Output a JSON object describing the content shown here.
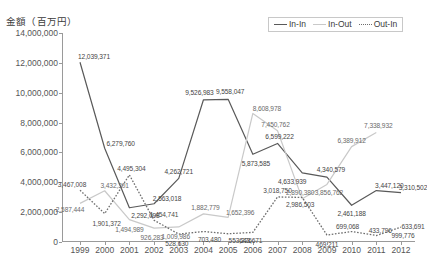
{
  "chart": {
    "axis": {
      "y_axis_title": "金額（百万円）",
      "y_ticks": [
        "14,000,000",
        "12,000,000",
        "10,000,000",
        "8,000,000",
        "6,000,000",
        "4,000,000",
        "2,000,000",
        "0"
      ]
    },
    "legend": {
      "items": [
        {
          "label": "In-In",
          "style": "solid",
          "color": "#595959"
        },
        {
          "label": "In-Out",
          "style": "solid",
          "color": "#c9c9c9"
        },
        {
          "label": "Out-In",
          "style": "dotted",
          "color": "#6e6e6e"
        }
      ]
    }
  },
  "chart_data": {
    "type": "line",
    "title": "",
    "xlabel": "",
    "ylabel": "金額（百万円）",
    "ylim": [
      0,
      14000000
    ],
    "ytick_step": 2000000,
    "grid": false,
    "legend_position": "top-right",
    "categories": [
      "1999",
      "2000",
      "2001",
      "2002",
      "2003",
      "2004",
      "2005",
      "2006",
      "2007",
      "2008",
      "2009",
      "2010",
      "2011",
      "2012"
    ],
    "series": [
      {
        "name": "In-In",
        "color": "#595959",
        "style": "solid",
        "values": [
          12039371,
          6279760,
          2292098,
          2563018,
          4262721,
          9526983,
          9558047,
          5873585,
          6599222,
          4633939,
          4340579,
          2461188,
          3447120,
          3310502
        ],
        "labels": [
          "12,039,371",
          "6,279,760",
          "2,292,098",
          "2,563,018",
          "4,262,721",
          "9,526,983",
          "9,558,047",
          "5,873,585",
          "6,599,222",
          "4,633,939",
          "4,340,579",
          "2,461,188",
          "3,447,120",
          "3,310,502"
        ]
      },
      {
        "name": "In-Out",
        "color": "#c9c9c9",
        "style": "solid",
        "values": [
          2587444,
          3432301,
          1494989,
          926283,
          1009986,
          1882779,
          1652396,
          8608978,
          7450762,
          2890380,
          3856762,
          6389912,
          7338932,
          null
        ],
        "labels": [
          "2,587,444",
          "3,432,301",
          "1,494,989",
          "926,283",
          "1,009,986",
          "1,882,779",
          "1,652,396",
          "8,608,978",
          "7,450,762",
          "2,890,380",
          "3,856,762",
          "6,389,912",
          "7,338,932",
          ""
        ]
      },
      {
        "name": "Out-In",
        "color": "#6e6e6e",
        "style": "dotted",
        "values": [
          3467008,
          1901372,
          4495304,
          1454741,
          528630,
          703480,
          553226,
          643671,
          3018750,
          2986503,
          469211,
          699068,
          433796,
          999776
        ],
        "labels": [
          "3,467,008",
          "1,901,372",
          "4,495,304",
          "1,454,741",
          "528,630",
          "703,480",
          "553,226",
          "643,671",
          "3,018,750",
          "2,986,503",
          "469,211",
          "699,068",
          "433,796",
          "999,776"
        ],
        "extra_label": "633,691"
      }
    ]
  }
}
